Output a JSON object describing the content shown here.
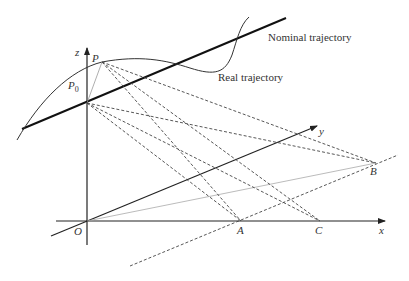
{
  "labels": {
    "nominal": "Nominal trajectory",
    "real": "Real trajectory",
    "z": "z",
    "y": "y",
    "x": "x",
    "O": "O",
    "P": "P",
    "P0": "P",
    "P0_sub": "0",
    "A": "A",
    "B": "B",
    "C": "C"
  },
  "colors": {
    "ink": "#222222",
    "light": "#9a9a9a",
    "dash": "#444444"
  }
}
